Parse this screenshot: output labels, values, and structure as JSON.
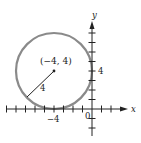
{
  "figure": {
    "type": "circle-on-coordinate-plane",
    "center_label": "(−4, 4)",
    "radius_label": "4",
    "x_axis_label": "x",
    "y_axis_label": "y",
    "origin_label": "0",
    "x_tick_label": "−4",
    "y_tick_label": "4",
    "center": [
      -4,
      4
    ],
    "radius": 4,
    "colors": {
      "circle": "#8a8a8a",
      "axes": "#222222",
      "text": "#222222"
    }
  }
}
